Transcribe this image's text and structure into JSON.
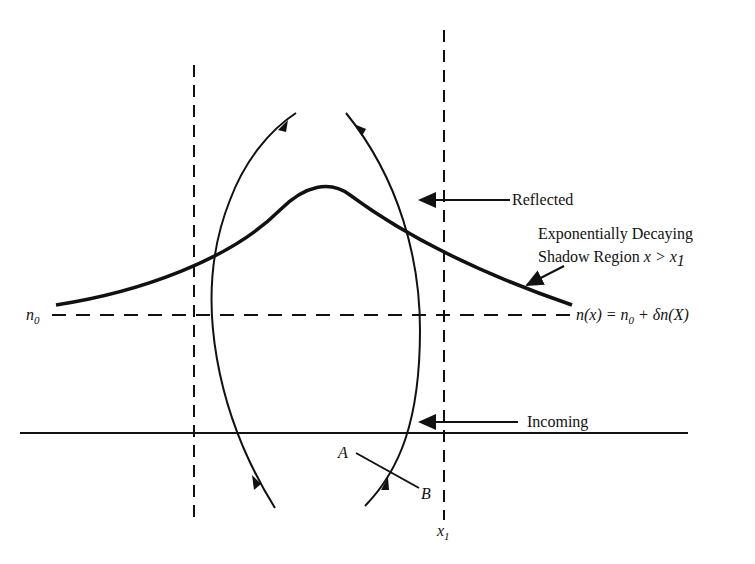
{
  "diagram": {
    "labels": {
      "reflected": "Reflected",
      "shadow_line1": "Exponentially Decaying",
      "shadow_line2_prefix": "Shadow Region ",
      "shadow_line2_math": "x > x",
      "shadow_line2_sub": "1",
      "n0_left": "n",
      "n0_left_sub": "0",
      "profile_eq_a": "n(x) = n",
      "profile_eq_sub": "0",
      "profile_eq_b": " + δn(X)",
      "incoming": "Incoming",
      "point_a": "A",
      "point_b": "B",
      "x1": "x",
      "x1_sub": "1"
    },
    "colors": {
      "ink": "#111111",
      "background": "#ffffff"
    }
  }
}
